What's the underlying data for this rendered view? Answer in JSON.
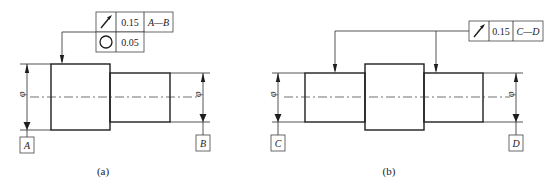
{
  "figures": [
    {
      "id": "a",
      "caption": "(a)",
      "feature_control_frame": {
        "rows": [
          {
            "symbol": "circular-runout",
            "symbol_glyph": "↗",
            "tolerance": "0.15",
            "datum": "A—B"
          },
          {
            "symbol": "circularity",
            "symbol_glyph": "○",
            "tolerance": "0.05",
            "datum": ""
          }
        ]
      },
      "datums": [
        "A",
        "B"
      ],
      "diameter_symbol": "φ"
    },
    {
      "id": "b",
      "caption": "(b)",
      "feature_control_frame": {
        "rows": [
          {
            "symbol": "circular-runout",
            "symbol_glyph": "↗",
            "tolerance": "0.15",
            "datum": "C—D"
          }
        ]
      },
      "datums": [
        "C",
        "D"
      ],
      "diameter_symbol": "φ"
    }
  ],
  "colors": {
    "line": "#1e1e1e",
    "background": "#ffffff"
  }
}
